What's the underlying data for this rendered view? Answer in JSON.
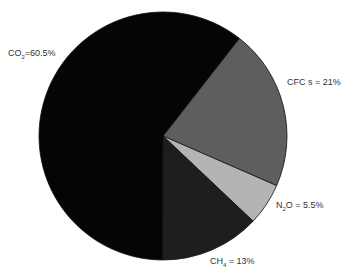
{
  "chart_data": {
    "type": "pie",
    "title": "",
    "slices": [
      {
        "label": "CO2",
        "display": "CO₂=60.5%",
        "value": 60.5,
        "color": "#050505"
      },
      {
        "label": "CFCs",
        "display": "CFC s = 21%",
        "value": 21,
        "color": "#5e5e5e"
      },
      {
        "label": "N2O",
        "display": "N₂O = 5.5%",
        "value": 5.5,
        "color": "#b4b4b4"
      },
      {
        "label": "CH4",
        "display": "CH₄ = 13%",
        "value": 13,
        "color": "#1e1e1e"
      }
    ],
    "start_angle_deg": 38,
    "direction": "clockwise",
    "legend": "none"
  },
  "labels": {
    "co2": {
      "main": "CO",
      "sub": "2",
      "rest": "=60.5%"
    },
    "cfcs": {
      "text": "CFC s = 21%"
    },
    "n2o": {
      "main": "N",
      "sub": "2",
      "rest": "O = 5.5%"
    },
    "ch4": {
      "main": "CH",
      "sub": "4",
      "rest": " = 13%"
    }
  }
}
